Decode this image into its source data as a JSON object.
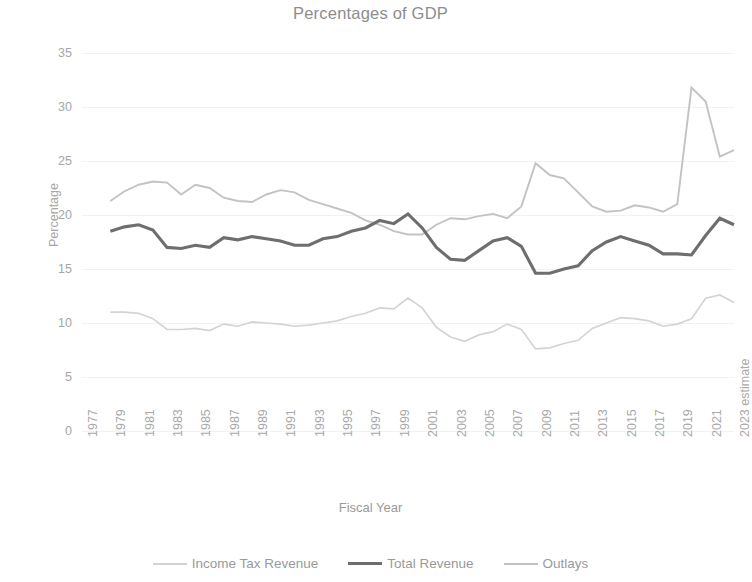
{
  "chart_data": {
    "type": "line",
    "title": "Percentages of GDP",
    "xlabel": "Fiscal Year",
    "ylabel": "Percentage",
    "ylim": [
      0,
      35
    ],
    "ytick_step": 5,
    "yticks": [
      "0",
      "5",
      "10",
      "15",
      "20",
      "25",
      "30",
      "35"
    ],
    "grid": true,
    "legend_position": "bottom",
    "xlim_years": [
      1977,
      2023
    ],
    "xticks": [
      "1977",
      "1979",
      "1981",
      "1983",
      "1985",
      "1987",
      "1989",
      "1991",
      "1993",
      "1995",
      "1997",
      "1999",
      "2001",
      "2003",
      "2005",
      "2007",
      "2009",
      "2011",
      "2013",
      "2015",
      "2017",
      "2019",
      "2021",
      "2023 estimate"
    ],
    "x": [
      1979,
      1980,
      1981,
      1982,
      1983,
      1984,
      1985,
      1986,
      1987,
      1988,
      1989,
      1990,
      1991,
      1992,
      1993,
      1994,
      1995,
      1996,
      1997,
      1998,
      1999,
      2000,
      2001,
      2002,
      2003,
      2004,
      2005,
      2006,
      2007,
      2008,
      2009,
      2010,
      2011,
      2012,
      2013,
      2014,
      2015,
      2016,
      2017,
      2018,
      2019,
      2020,
      2021,
      2022,
      2023
    ],
    "series": [
      {
        "name": "Outlays",
        "color": "#c3c3c3",
        "values": [
          21.3,
          22.2,
          22.8,
          23.1,
          23.0,
          21.9,
          22.8,
          22.5,
          21.6,
          21.3,
          21.2,
          21.9,
          22.3,
          22.1,
          21.4,
          21.0,
          20.6,
          20.2,
          19.5,
          19.1,
          18.5,
          18.2,
          18.2,
          19.1,
          19.7,
          19.6,
          19.9,
          20.1,
          19.7,
          20.8,
          24.8,
          23.7,
          23.4,
          22.1,
          20.8,
          20.3,
          20.4,
          20.9,
          20.7,
          20.3,
          21.0,
          31.8,
          30.5,
          25.4,
          26.0
        ]
      },
      {
        "name": "Total Revenue",
        "color": "#6e6e6e",
        "values": [
          18.5,
          18.9,
          19.1,
          18.6,
          17.0,
          16.9,
          17.2,
          17.0,
          17.9,
          17.7,
          18.0,
          17.8,
          17.6,
          17.2,
          17.2,
          17.8,
          18.0,
          18.5,
          18.8,
          19.5,
          19.2,
          20.1,
          18.8,
          17.0,
          15.9,
          15.8,
          16.7,
          17.6,
          17.9,
          17.1,
          14.6,
          14.6,
          15.0,
          15.3,
          16.7,
          17.5,
          18.0,
          17.6,
          17.2,
          16.4,
          16.4,
          16.3,
          18.1,
          19.7,
          19.1
        ]
      },
      {
        "name": "Income Tax Revenue",
        "color": "#d4d4d4",
        "values": [
          11.0,
          11.0,
          10.9,
          10.4,
          9.4,
          9.4,
          9.5,
          9.3,
          9.9,
          9.7,
          10.1,
          10.0,
          9.9,
          9.7,
          9.8,
          10.0,
          10.2,
          10.6,
          10.9,
          11.4,
          11.3,
          12.3,
          11.4,
          9.6,
          8.7,
          8.3,
          8.9,
          9.2,
          9.9,
          9.4,
          7.6,
          7.7,
          8.1,
          8.4,
          9.5,
          10.0,
          10.5,
          10.4,
          10.2,
          9.7,
          9.9,
          10.4,
          12.3,
          12.6,
          11.9
        ]
      }
    ]
  },
  "legend": {
    "items": [
      {
        "label": "Income Tax Revenue"
      },
      {
        "label": "Total Revenue"
      },
      {
        "label": "Outlays"
      }
    ]
  }
}
